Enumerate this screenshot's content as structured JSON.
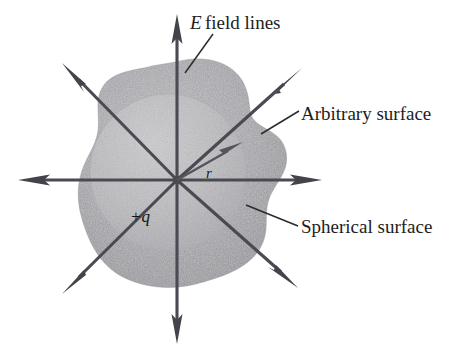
{
  "figure": {
    "background_color": "#ffffff"
  },
  "labels": {
    "e_field_symbol": "E",
    "e_field_rest": "field lines",
    "arbitrary_surface": "Arbitrary surface",
    "spherical_surface": "Spherical surface",
    "charge": "+q",
    "radius": "r"
  },
  "colors": {
    "field_line": "#4a4a52",
    "arrowhead": "#43434b",
    "arbitrary_surface_fill": "#9f9fa4",
    "spherical_surface_fill": "#c3c3c6",
    "leader_line": "#2b2b2b",
    "text": "#1d1d1d"
  },
  "geometry": {
    "center_x": 177,
    "center_y": 180,
    "field_line_count": 8,
    "sphere_center_x": 168,
    "sphere_center_y": 172,
    "sphere_radius": 78,
    "radius_arrow_angle_deg": 35
  }
}
